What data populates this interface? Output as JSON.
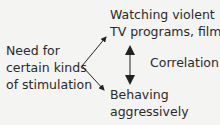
{
  "diagram": {
    "cause": [
      "Need for",
      "certain kinds",
      "of stimulation"
    ],
    "effect_top": [
      "Watching violent",
      "TV programs, films"
    ],
    "effect_bottom": [
      "Behaving",
      "aggressively"
    ],
    "relation_label": "Correlation"
  }
}
